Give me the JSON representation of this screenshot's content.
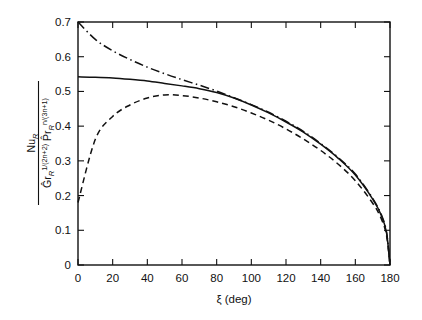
{
  "figure": {
    "background": "#ffffff",
    "ink_color": "#111111"
  },
  "axes": {
    "x": {
      "label": "ξ (deg)",
      "label_symbol": "ξ",
      "label_unit": "(deg)",
      "min": 0,
      "max": 180,
      "tick_step": 20,
      "tick_labels": [
        "0",
        "20",
        "40",
        "60",
        "80",
        "100",
        "120",
        "140",
        "160",
        "180"
      ],
      "tick_values": [
        0,
        20,
        40,
        60,
        80,
        100,
        120,
        140,
        160,
        180
      ]
    },
    "y": {
      "min": 0,
      "max": 0.7,
      "tick_step": 0.1,
      "tick_labels": [
        "0",
        "0.1",
        "0.2",
        "0.3",
        "0.4",
        "0.5",
        "0.6",
        "0.7"
      ],
      "tick_values": [
        0,
        0.1,
        0.2,
        0.3,
        0.4,
        0.5,
        0.6,
        0.7
      ],
      "label_numerator": "Nu",
      "label_numerator_sub": "R",
      "label_denominator_term1_base": "Ĝr",
      "label_denominator_term1_sub": "R",
      "label_denominator_term1_sup": "1/(2n+2)",
      "label_denominator_term2_base": "P̂r",
      "label_denominator_term2_sub": "R",
      "label_denominator_term2_sup": "n/(3n+1)"
    }
  },
  "chart_data": {
    "type": "line",
    "title": "",
    "xlabel": "ξ (deg)",
    "ylabel": "Nu_R / ( Ghat_r_R^(1/(2n+2)) Phat_r_R^(n/(3n+1)) )",
    "xlim": [
      0,
      180
    ],
    "ylim": [
      0,
      0.7
    ],
    "grid": false,
    "legend": "none",
    "x": [
      0,
      10,
      20,
      30,
      40,
      50,
      60,
      70,
      80,
      90,
      100,
      110,
      120,
      130,
      140,
      150,
      160,
      170,
      175,
      178,
      180
    ],
    "series": [
      {
        "name": "dash-dot curve",
        "style": "dashdot",
        "values": [
          0.7,
          0.65,
          0.617,
          0.592,
          0.57,
          0.551,
          0.534,
          0.518,
          0.501,
          0.482,
          0.462,
          0.44,
          0.414,
          0.385,
          0.35,
          0.31,
          0.262,
          0.192,
          0.145,
          0.095,
          0.0
        ]
      },
      {
        "name": "solid curve",
        "style": "solid",
        "values": [
          0.542,
          0.541,
          0.539,
          0.535,
          0.53,
          0.523,
          0.516,
          0.508,
          0.497,
          0.481,
          0.461,
          0.438,
          0.412,
          0.383,
          0.348,
          0.308,
          0.259,
          0.19,
          0.143,
          0.093,
          0.0
        ]
      },
      {
        "name": "dashed curve",
        "style": "dashed",
        "values": [
          0.18,
          0.362,
          0.428,
          0.461,
          0.481,
          0.49,
          0.488,
          0.481,
          0.47,
          0.456,
          0.438,
          0.417,
          0.392,
          0.363,
          0.33,
          0.291,
          0.243,
          0.178,
          0.133,
          0.085,
          0.0
        ]
      }
    ]
  }
}
